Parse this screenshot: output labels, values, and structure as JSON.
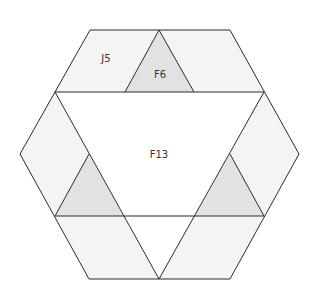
{
  "diagram": {
    "type": "hexagonal quilt block",
    "colors": {
      "background": "#ffffff",
      "light_panel": "#f4f4f4",
      "triangle": "#e2e2e2",
      "center": "#ffffff",
      "stroke": "#2b2b2b"
    },
    "labels": {
      "top_left_panel": "J5",
      "top_triangle": "F6",
      "center_triangle": "F13"
    },
    "shapes": [
      {
        "id": "top-left-panel",
        "label": "J5",
        "points": "90,30 159,30 125,92 55,92",
        "fill": "light_panel"
      },
      {
        "id": "top-right-panel",
        "points": "159,30 230,30 264,92 194,92",
        "fill": "light_panel"
      },
      {
        "id": "top-triangle",
        "label": "F6",
        "points": "159,30 194,92 125,92",
        "fill": "triangle"
      },
      {
        "id": "left-upper-panel",
        "points": "55,92 89,154 55,216 20,154",
        "fill": "light_panel"
      },
      {
        "id": "left-triangle",
        "points": "89,154 123,216 55,216",
        "fill": "triangle"
      },
      {
        "id": "right-upper-panel",
        "points": "264,92 299,154 264,216 230,154",
        "fill": "light_panel"
      },
      {
        "id": "right-triangle",
        "points": "230,154 264,216 195,216",
        "fill": "triangle"
      },
      {
        "id": "bottom-left-panel",
        "points": "55,216 123,216 159,279 89,279",
        "fill": "light_panel"
      },
      {
        "id": "bottom-right-panel",
        "points": "195,216 264,216 230,279 159,279",
        "fill": "light_panel"
      },
      {
        "id": "center-triangle",
        "label": "F13",
        "points": "55,92 264,92 159,279",
        "fill": "center"
      }
    ]
  }
}
